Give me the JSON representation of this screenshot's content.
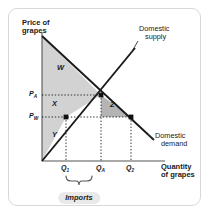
{
  "figure": {
    "axes": {
      "y_title_line1": "Price of",
      "y_title_line2": "grapes",
      "x_title_line1": "Quantity",
      "x_title_line2": "of grapes"
    },
    "curves": [
      {
        "id": "supply",
        "label_line1": "Domestic",
        "label_line2": "supply"
      },
      {
        "id": "demand",
        "label_line1": "Domestic",
        "label_line2": "demand"
      }
    ],
    "price_ticks": [
      {
        "id": "autarky-price",
        "base": "P",
        "sub": "A"
      },
      {
        "id": "world-price",
        "base": "P",
        "sub": "W"
      }
    ],
    "quantity_ticks": [
      {
        "id": "quantity-supplied",
        "base": "Q",
        "sub": "1"
      },
      {
        "id": "quantity-autarky",
        "base": "Q",
        "sub": "A"
      },
      {
        "id": "quantity-demanded",
        "base": "Q",
        "sub": "2"
      }
    ],
    "regions": [
      {
        "id": "region-w",
        "label": "W"
      },
      {
        "id": "region-x",
        "label": "X"
      },
      {
        "id": "region-y",
        "label": "Y"
      },
      {
        "id": "region-z",
        "label": "Z"
      }
    ],
    "brace_label": "Imports",
    "colors": {
      "surplus_light": "#d2d2d2",
      "surplus_dark": "#b4b4b4",
      "curve": "#1a1a1a",
      "axis": "#555555",
      "card_border": "#d8d8d8",
      "pill_bg": "#e9e9e9"
    }
  }
}
